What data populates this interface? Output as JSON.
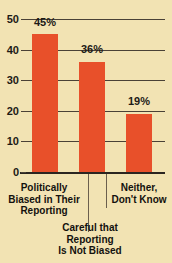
{
  "chart_data": {
    "type": "bar",
    "title": "",
    "subtitle": "",
    "xlabel": "",
    "ylabel": "",
    "ylim": [
      0,
      50
    ],
    "yticks": [
      "0",
      "10",
      "20",
      "30",
      "40",
      "50"
    ],
    "grid": true,
    "legend": null,
    "bar_color": "#e8502a",
    "background_color": "#f2e3b3",
    "categories": [
      "Politically\nBiased in Their\nReporting",
      "Careful that\nReporting\nIs Not Biased",
      "Neither,\nDon't Know"
    ],
    "values": [
      45,
      36,
      19
    ],
    "data_labels": [
      "45%",
      "36%",
      "19%"
    ]
  }
}
